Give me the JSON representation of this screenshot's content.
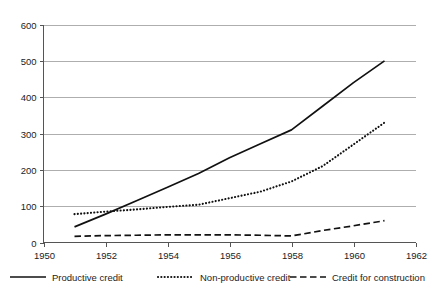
{
  "chart_data": {
    "type": "line",
    "title": "",
    "subtitle": "",
    "xlabel": "",
    "ylabel": "",
    "xlim": [
      1950,
      1962
    ],
    "ylim": [
      0,
      600
    ],
    "xticks": [
      1950,
      1952,
      1954,
      1956,
      1958,
      1960,
      1962
    ],
    "yticks": [
      0,
      100,
      200,
      300,
      400,
      500,
      600
    ],
    "xtick_labels": [
      "1950",
      "1952",
      "1954",
      "1956",
      "1958",
      "1960",
      "1962"
    ],
    "ytick_labels": [
      "0",
      "100",
      "200",
      "300",
      "400",
      "500",
      "600"
    ],
    "grid": "horizontal",
    "legend_position": "bottom",
    "x": [
      1951,
      1952,
      1953,
      1954,
      1955,
      1956,
      1957,
      1958,
      1959,
      1960,
      1961
    ],
    "series": [
      {
        "name": "Productive credit",
        "style": "solid",
        "color": "#111111",
        "values": [
          43,
          78,
          115,
          152,
          190,
          233,
          272,
          310,
          375,
          440,
          500
        ]
      },
      {
        "name": "Non-productive credit",
        "style": "dotted",
        "color": "#111111",
        "values": [
          78,
          85,
          91,
          98,
          104,
          122,
          140,
          168,
          210,
          270,
          330
        ]
      },
      {
        "name": "Credit for construction",
        "style": "dashed",
        "color": "#111111",
        "values": [
          17,
          19,
          20,
          21,
          21,
          21,
          20,
          18,
          33,
          46,
          60
        ]
      }
    ]
  },
  "legend": {
    "items": [
      {
        "label": "Productive credit",
        "style": "solid"
      },
      {
        "label": "Non-productive credit",
        "style": "dotted"
      },
      {
        "label": "Credit for construction",
        "style": "dashed"
      }
    ]
  },
  "colors": {
    "ink": "#111111",
    "grid": "#9a9a9a",
    "axis": "#555555",
    "background": "#ffffff"
  }
}
